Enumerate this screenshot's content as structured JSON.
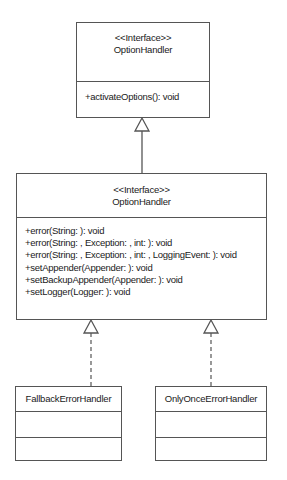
{
  "diagram": {
    "top_interface": {
      "stereotype": "<<Interface>>",
      "name": "OptionHandler",
      "operations": [
        "+activateOptions(): void"
      ]
    },
    "middle_interface": {
      "stereotype": "<<Interface>>",
      "name": "OptionHandler",
      "operations": [
        "+error(String: ): void",
        "+error(String: , Exception: , int: ): void",
        "+error(String: , Exception: , int: , LoggingEvent: ): void",
        "+setAppender(Appender: ): void",
        "+setBackupAppender(Appender: ): void",
        "+setLogger(Logger: ): void"
      ]
    },
    "classes": [
      {
        "name": "FallbackErrorHandler"
      },
      {
        "name": "OnlyOnceErrorHandler"
      }
    ],
    "relationships": [
      {
        "type": "generalization",
        "from": "middle_interface",
        "to": "top_interface"
      },
      {
        "type": "realization",
        "from": "FallbackErrorHandler",
        "to": "middle_interface"
      },
      {
        "type": "realization",
        "from": "OnlyOnceErrorHandler",
        "to": "middle_interface"
      }
    ],
    "colors": {
      "line": "#555555",
      "text": "#1a1a1a",
      "background": "#ffffff"
    }
  }
}
